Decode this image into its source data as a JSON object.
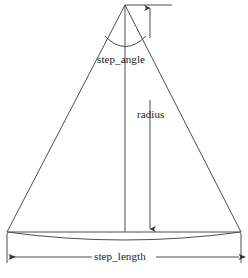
{
  "diagram": {
    "background_color": "#ffffff",
    "line_color": "#4d4d4d",
    "text_color": "#1a1a1a",
    "labels": {
      "step_angle": "step_angle",
      "radius": "radius",
      "step_length": "step_length"
    },
    "caption_fragment": "",
    "geometry": {
      "apex": {
        "x": 125,
        "y": 5
      },
      "base_left": {
        "x": 7,
        "y": 232
      },
      "base_right": {
        "x": 241,
        "y": 232
      },
      "arc_sagitta_y": 240,
      "angle_arc_y": 48,
      "center_axis_x": 125,
      "radius_dim_x": 150,
      "radius_dim_top_y": 5,
      "radius_dim_bottom_y": 232,
      "length_dim_y": 257,
      "extension_left_x": 7,
      "extension_right_x": 241,
      "top_extension_end_x": 172
    }
  }
}
